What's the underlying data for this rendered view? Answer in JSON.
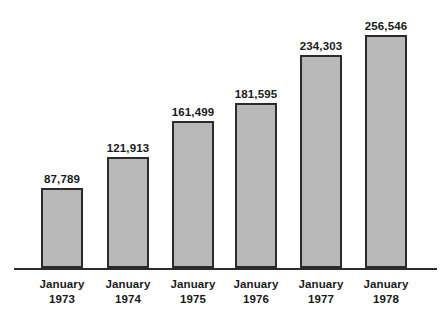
{
  "chart_data": {
    "type": "bar",
    "title": "",
    "subtitle": "",
    "xlabel": "",
    "ylabel": "",
    "categories": [
      "January 1973",
      "January 1974",
      "January 1975",
      "January 1976",
      "January 1977",
      "January 1978"
    ],
    "category_lines": [
      {
        "month": "January",
        "year": "1973"
      },
      {
        "month": "January",
        "year": "1974"
      },
      {
        "month": "January",
        "year": "1975"
      },
      {
        "month": "January",
        "year": "1976"
      },
      {
        "month": "January",
        "year": "1977"
      },
      {
        "month": "January",
        "year": "1978"
      }
    ],
    "values": [
      87789,
      121913,
      161499,
      181595,
      234303,
      256546
    ],
    "value_labels": [
      "87,789",
      "121,913",
      "161,499",
      "181,595",
      "234,303",
      "256,546"
    ],
    "ylim": [
      0,
      295000
    ],
    "grid": false,
    "legend": null,
    "y_axis_visible": false,
    "x_axis_visible": true,
    "colors": {
      "bar_fill": "#b9b9b9",
      "bar_border": "#2b2b2b",
      "axis": "#2b2b2b",
      "text": "#1a1a1a",
      "background": "#ffffff"
    }
  }
}
